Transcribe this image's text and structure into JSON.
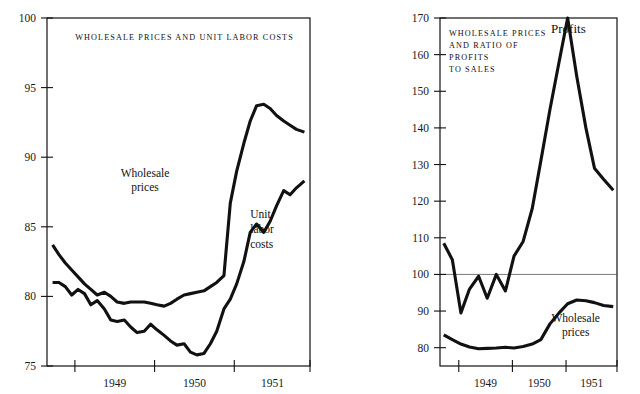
{
  "figure": {
    "top_caption": "",
    "background": "#ffffff",
    "ink_color": "#111111"
  },
  "chart_data": [
    {
      "id": "left",
      "type": "line",
      "title": "WHOLESALE PRICES AND UNIT LABOR COSTS",
      "xlabel": "",
      "ylabel": "",
      "xlim": [
        1948.55,
        1951.85
      ],
      "ylim": [
        75,
        100
      ],
      "yticks": [
        75,
        80,
        85,
        90,
        95,
        100
      ],
      "xticks": [
        1948.9,
        1949.9,
        1950.9,
        1951.85
      ],
      "xtick_labels": [
        "1949",
        "1950",
        "1951"
      ],
      "grid": false,
      "legend": "inline-annotations",
      "series": [
        {
          "name": "Wholesale prices",
          "label_x": 1949.78,
          "label_y": 88.6,
          "x": [
            1948.62,
            1948.7,
            1948.78,
            1948.86,
            1948.94,
            1949.02,
            1949.1,
            1949.18,
            1949.27,
            1949.35,
            1949.43,
            1949.52,
            1949.6,
            1949.68,
            1949.77,
            1949.85,
            1949.93,
            1950.02,
            1950.1,
            1950.18,
            1950.27,
            1950.35,
            1950.43,
            1950.52,
            1950.6,
            1950.68,
            1950.77,
            1950.85,
            1950.93,
            1951.02,
            1951.1,
            1951.18,
            1951.27,
            1951.35,
            1951.43,
            1951.52,
            1951.6,
            1951.68,
            1951.78
          ],
          "y": [
            83.7,
            83.0,
            82.4,
            81.9,
            81.4,
            80.9,
            80.5,
            80.1,
            80.3,
            80.0,
            79.6,
            79.5,
            79.6,
            79.6,
            79.6,
            79.5,
            79.4,
            79.3,
            79.5,
            79.8,
            80.1,
            80.2,
            80.3,
            80.4,
            80.7,
            81.0,
            81.5,
            86.7,
            89.0,
            91.0,
            92.6,
            93.7,
            93.8,
            93.5,
            93.0,
            92.6,
            92.3,
            92.0,
            91.8
          ]
        },
        {
          "name": "Unit labor costs",
          "label_x": 1951.1,
          "label_y": 85.6,
          "x": [
            1948.62,
            1948.7,
            1948.78,
            1948.86,
            1948.94,
            1949.02,
            1949.1,
            1949.18,
            1949.27,
            1949.35,
            1949.43,
            1949.52,
            1949.6,
            1949.68,
            1949.77,
            1949.85,
            1949.93,
            1950.02,
            1950.1,
            1950.18,
            1950.27,
            1950.35,
            1950.43,
            1950.52,
            1950.6,
            1950.68,
            1950.77,
            1950.85,
            1950.93,
            1951.02,
            1951.1,
            1951.18,
            1951.27,
            1951.35,
            1951.43,
            1951.52,
            1951.6,
            1951.68,
            1951.78
          ],
          "y": [
            81.0,
            81.0,
            80.7,
            80.1,
            80.5,
            80.2,
            79.4,
            79.7,
            79.1,
            78.3,
            78.2,
            78.3,
            77.8,
            77.4,
            77.5,
            78.0,
            77.6,
            77.2,
            76.8,
            76.5,
            76.6,
            76.0,
            75.8,
            75.9,
            76.6,
            77.5,
            79.1,
            79.8,
            80.9,
            82.5,
            84.6,
            85.2,
            84.6,
            85.4,
            86.5,
            87.6,
            87.3,
            87.8,
            88.3
          ]
        }
      ]
    },
    {
      "id": "right",
      "type": "line",
      "title_lines": [
        "WHOLESALE PRICES",
        "AND RATIO OF",
        "PROFITS",
        "TO SALES"
      ],
      "xlabel": "",
      "ylabel": "",
      "xlim": [
        1948.55,
        1951.85
      ],
      "ylim": [
        75,
        170
      ],
      "yticks": [
        80,
        90,
        100,
        110,
        120,
        130,
        140,
        150,
        160,
        170
      ],
      "xticks": [
        1948.9,
        1949.9,
        1950.9,
        1951.85
      ],
      "xtick_labels": [
        "1949",
        "1950",
        "1951"
      ],
      "grid": false,
      "reference_line": 100,
      "legend": "inline-annotations",
      "series": [
        {
          "name": "Profits",
          "label_x": 1950.62,
          "label_y": 166.0,
          "x": [
            1948.62,
            1948.78,
            1948.94,
            1949.1,
            1949.27,
            1949.43,
            1949.6,
            1949.77,
            1949.93,
            1950.1,
            1950.27,
            1950.43,
            1950.6,
            1950.77,
            1950.93,
            1951.1,
            1951.27,
            1951.43,
            1951.6,
            1951.78
          ],
          "y": [
            108.5,
            104.0,
            89.5,
            96.0,
            99.5,
            93.5,
            100.0,
            95.5,
            105.0,
            109.0,
            118.0,
            131.0,
            145.0,
            158.0,
            170.0,
            154.0,
            140.0,
            129.0,
            126.0,
            123.0
          ]
        },
        {
          "name": "Wholesale prices",
          "label_x": 1951.08,
          "label_y": 87.0,
          "x": [
            1948.62,
            1948.78,
            1948.94,
            1949.1,
            1949.27,
            1949.43,
            1949.6,
            1949.77,
            1949.93,
            1950.1,
            1950.27,
            1950.43,
            1950.6,
            1950.77,
            1950.93,
            1951.1,
            1951.27,
            1951.43,
            1951.6,
            1951.78
          ],
          "y": [
            83.5,
            82.2,
            81.0,
            80.2,
            79.7,
            79.8,
            79.9,
            80.1,
            79.9,
            80.3,
            81.0,
            82.2,
            86.5,
            89.5,
            92.0,
            93.0,
            92.8,
            92.3,
            91.5,
            91.2
          ]
        }
      ]
    }
  ]
}
